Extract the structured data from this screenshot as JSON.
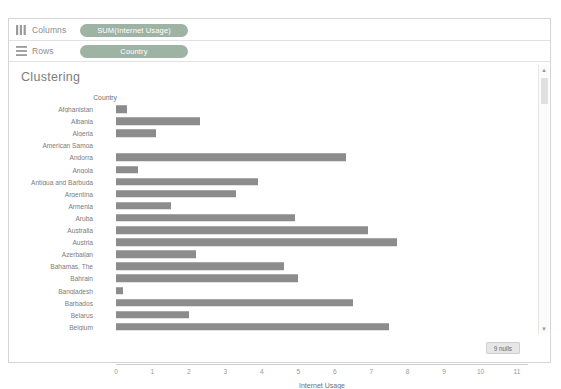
{
  "shelves": {
    "columns": {
      "label": "Columns",
      "icon": "columns-icon",
      "pill": "SUM(Internet Usage)"
    },
    "rows": {
      "label": "Rows",
      "icon": "rows-icon",
      "pill": "Country"
    }
  },
  "worksheet": {
    "title": "Clustering",
    "nulls_badge": "9 nulls",
    "row_header_title": "Country"
  },
  "chart_data": {
    "type": "bar",
    "orientation": "horizontal",
    "title": "Clustering",
    "xlabel": "Internet Usage",
    "ylabel": "Country",
    "xlim": [
      0,
      11.3
    ],
    "xticks": [
      "0",
      "1",
      "2",
      "3",
      "4",
      "5",
      "6",
      "7",
      "8",
      "9",
      "10",
      "11"
    ],
    "grid": false,
    "bar_color": "#8c8c8c",
    "null_count": 9,
    "categories": [
      "Afghanistan",
      "Albania",
      "Algeria",
      "American Samoa",
      "Andorra",
      "Angola",
      "Antigua and Barbuda",
      "Argentina",
      "Armenia",
      "Aruba",
      "Australia",
      "Austria",
      "Azerbaijan",
      "Bahamas, The",
      "Bahrain",
      "Bangladesh",
      "Barbados",
      "Belarus",
      "Belgium"
    ],
    "values": [
      0.3,
      2.3,
      1.1,
      null,
      6.3,
      0.6,
      3.9,
      3.3,
      1.5,
      4.9,
      6.9,
      7.7,
      2.2,
      4.6,
      5.0,
      0.2,
      6.5,
      2.0,
      7.5
    ]
  },
  "scrollbar": {
    "up_arrow": "▲",
    "down_arrow": "▼"
  }
}
